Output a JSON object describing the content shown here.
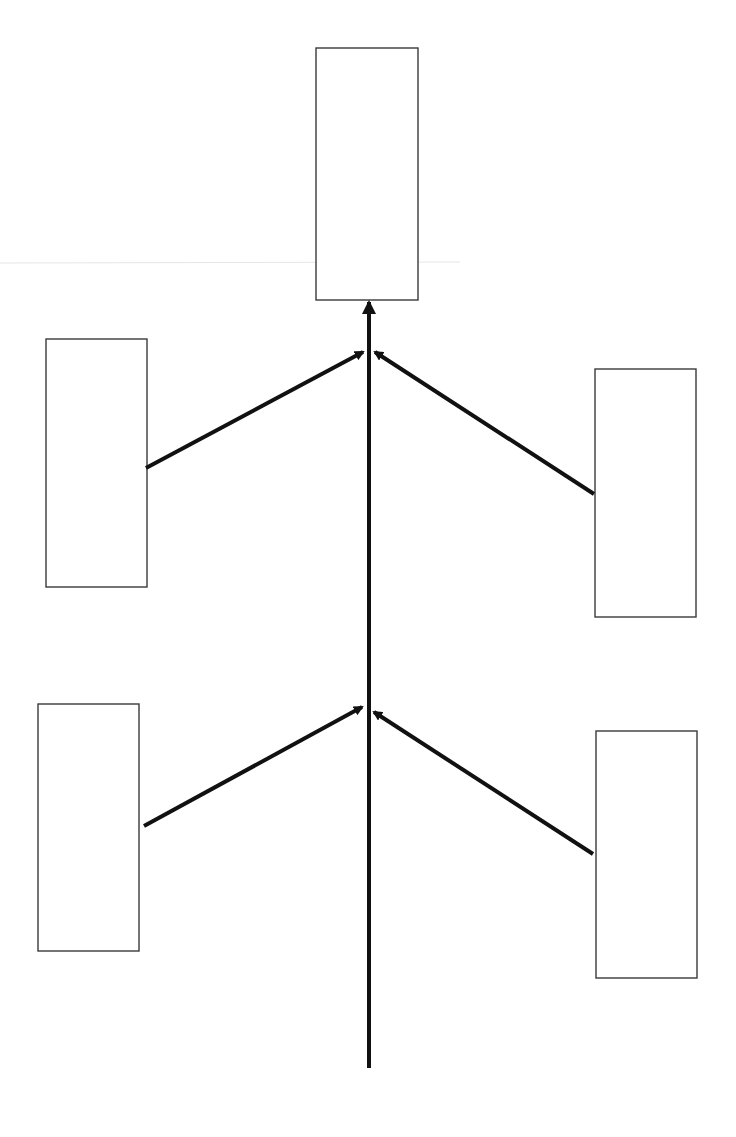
{
  "diagram": {
    "type": "fishbone-style converging arrow diagram",
    "background": "#ffffff",
    "line_color": "#111111",
    "box_border_color": "#3a3a3a",
    "boxes": [
      {
        "id": "outcome",
        "position": "top-center",
        "x": 316,
        "y": 48,
        "width": 102,
        "height": 252,
        "label": ""
      },
      {
        "id": "upper-left",
        "position": "upper-left",
        "x": 46,
        "y": 339,
        "width": 101,
        "height": 248,
        "label": ""
      },
      {
        "id": "upper-right",
        "position": "upper-right",
        "x": 595,
        "y": 369,
        "width": 101,
        "height": 248,
        "label": ""
      },
      {
        "id": "lower-left",
        "position": "lower-left",
        "x": 38,
        "y": 704,
        "width": 101,
        "height": 247,
        "label": ""
      },
      {
        "id": "lower-right",
        "position": "lower-right",
        "x": 596,
        "y": 731,
        "width": 101,
        "height": 247,
        "label": ""
      }
    ],
    "spine": {
      "x": 369,
      "y_start": 1068,
      "y_end": 302
    },
    "branches": [
      {
        "id": "upper-left-branch",
        "from": [
          146,
          468
        ],
        "to": [
          363,
          352
        ]
      },
      {
        "id": "upper-right-branch",
        "from": [
          594,
          494
        ],
        "to": [
          375,
          352
        ]
      },
      {
        "id": "lower-left-branch",
        "from": [
          144,
          826
        ],
        "to": [
          362,
          707
        ]
      },
      {
        "id": "lower-right-branch",
        "from": [
          593,
          854
        ],
        "to": [
          374,
          712
        ]
      }
    ]
  }
}
